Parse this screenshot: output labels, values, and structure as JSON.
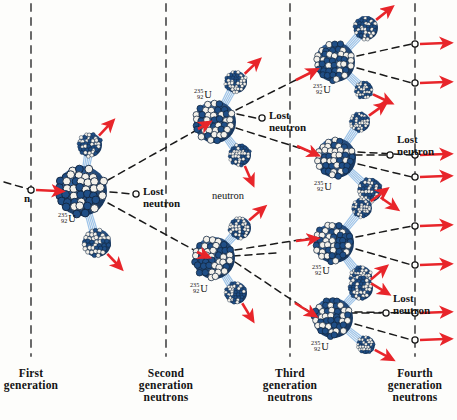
{
  "figure": {
    "type": "diagram",
    "width": 457,
    "height": 420,
    "background": "#fdfdfb"
  },
  "colors": {
    "arrow_red": "#e8252a",
    "nucleon_blue": "#1f4e86",
    "nucleon_dark": "#16355c",
    "nucleon_white": "#f4f1ea",
    "dashed_black": "#1a1a1a",
    "divider_gray": "#5a5a5a",
    "gamma_blue": "#9fc4e8",
    "text": "#141414"
  },
  "isotope": {
    "mass_number": "235",
    "atomic_number": "92",
    "symbol": "U"
  },
  "labels": {
    "incident_neutron": "n",
    "neutron": "neutron",
    "lost_neutron_line1": "Lost",
    "lost_neutron_line2": "neutron"
  },
  "generations": [
    {
      "id": "first",
      "line1": "First",
      "line2": "generation",
      "line3": "",
      "divider_x": 31
    },
    {
      "id": "second",
      "line1": "Second",
      "line2": "generation",
      "line3": "neutrons",
      "divider_x": 166
    },
    {
      "id": "third",
      "line1": "Third",
      "line2": "generation",
      "line3": "neutrons",
      "divider_x": 290
    },
    {
      "id": "fourth",
      "line1": "Fourth",
      "line2": "generation",
      "line3": "neutrons",
      "divider_x": 415
    }
  ],
  "lost_neutrons": [
    {
      "id": "lost-1",
      "x": 136,
      "y": 194,
      "text_x": 143,
      "text_y": 186
    },
    {
      "id": "lost-2",
      "x": 262,
      "y": 118,
      "text_x": 269,
      "text_y": 110
    },
    {
      "id": "lost-3",
      "x": 390,
      "y": 155,
      "text_x": 397,
      "text_y": 134
    },
    {
      "id": "lost-4",
      "x": 386,
      "y": 313,
      "text_x": 393,
      "text_y": 293
    }
  ],
  "standalone_labels": [
    {
      "id": "neutron-label",
      "text": "neutron",
      "x": 212,
      "y": 190
    },
    {
      "id": "n-label",
      "x": 24,
      "y": 193
    }
  ],
  "fission_events": [
    {
      "id": "gen1-main",
      "generation": 1,
      "cx": 82,
      "cy": 191,
      "r": 25,
      "label_x": 58,
      "label_y": 212
    },
    {
      "id": "gen2-upper",
      "generation": 2,
      "cx": 215,
      "cy": 122,
      "r": 21,
      "label_x": 194,
      "label_y": 88
    },
    {
      "id": "gen2-lower",
      "generation": 2,
      "cx": 214,
      "cy": 258,
      "r": 21,
      "label_x": 190,
      "label_y": 282
    },
    {
      "id": "gen3-top",
      "generation": 3,
      "cx": 335,
      "cy": 62,
      "r": 20,
      "label_x": 313,
      "label_y": 83
    },
    {
      "id": "gen3-upper-mid",
      "generation": 3,
      "cx": 336,
      "cy": 158,
      "r": 20,
      "label_x": 314,
      "label_y": 180
    },
    {
      "id": "gen3-lower-mid",
      "generation": 3,
      "cx": 334,
      "cy": 243,
      "r": 20,
      "label_x": 312,
      "label_y": 264
    },
    {
      "id": "gen3-bottom",
      "generation": 3,
      "cx": 333,
      "cy": 318,
      "r": 20,
      "label_x": 311,
      "label_y": 340
    }
  ],
  "fragments": [
    {
      "id": "frag-g1-up",
      "cx": 90,
      "cy": 145,
      "r": 12
    },
    {
      "id": "frag-g1-dn",
      "cx": 97,
      "cy": 243,
      "r": 14
    },
    {
      "id": "frag-g2u-up",
      "cx": 236,
      "cy": 82,
      "r": 11
    },
    {
      "id": "frag-g2u-dn",
      "cx": 240,
      "cy": 155,
      "r": 11
    },
    {
      "id": "frag-g2l-up",
      "cx": 240,
      "cy": 228,
      "r": 11
    },
    {
      "id": "frag-g2l-dn",
      "cx": 236,
      "cy": 293,
      "r": 11
    },
    {
      "id": "frag-g3t-up",
      "cx": 366,
      "cy": 28,
      "r": 12
    },
    {
      "id": "frag-g3t-dn",
      "cx": 364,
      "cy": 90,
      "r": 9
    },
    {
      "id": "frag-g3um-up",
      "cx": 360,
      "cy": 122,
      "r": 10
    },
    {
      "id": "frag-g3um-dn",
      "cx": 370,
      "cy": 190,
      "r": 12
    },
    {
      "id": "frag-g3lm-up",
      "cx": 362,
      "cy": 208,
      "r": 10
    },
    {
      "id": "frag-g3lm-dn",
      "cx": 361,
      "cy": 277,
      "r": 11
    },
    {
      "id": "frag-g3b-up",
      "cx": 361,
      "cy": 288,
      "r": 12
    },
    {
      "id": "frag-g3b-dn",
      "cx": 366,
      "cy": 345,
      "r": 9
    }
  ],
  "fourth_gen_crossings": [
    {
      "id": "cross-1",
      "y": 44
    },
    {
      "id": "cross-2",
      "y": 83
    },
    {
      "id": "cross-3",
      "y": 155
    },
    {
      "id": "cross-4",
      "y": 177
    },
    {
      "id": "cross-5",
      "y": 226
    },
    {
      "id": "cross-6",
      "y": 265
    },
    {
      "id": "cross-7",
      "y": 313
    },
    {
      "id": "cross-8",
      "y": 340
    }
  ]
}
